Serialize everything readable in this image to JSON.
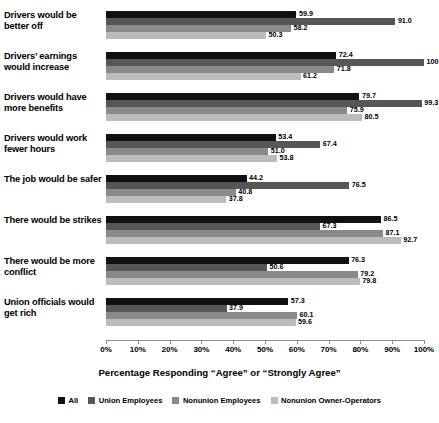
{
  "chart_data": {
    "type": "bar",
    "orientation": "horizontal",
    "title": "",
    "xlabel": "Percentage Responding “Agree” or “Strongly Agree”",
    "ylabel": "",
    "xlim": [
      0,
      100
    ],
    "grid": false,
    "legend_position": "bottom",
    "tick_labels": [
      "0%",
      "10%",
      "20%",
      "30%",
      "40%",
      "50%",
      "60%",
      "70%",
      "80%",
      "90%",
      "100%"
    ],
    "tick_values": [
      0,
      10,
      20,
      30,
      40,
      50,
      60,
      70,
      80,
      90,
      100
    ],
    "categories": [
      "Drivers would be better off",
      "Drivers’ earnings would increase",
      "Drivers would have more benefits",
      "Drivers would work fewer hours",
      "The job would be safer",
      "There would be strikes",
      "There would be more conflict",
      "Union officials would get rich"
    ],
    "series": [
      {
        "name": "All",
        "color": "#111111",
        "values": [
          59.9,
          72.4,
          79.7,
          53.4,
          44.2,
          86.5,
          76.3,
          57.3
        ],
        "labels": [
          "59.9",
          "72.4",
          "79.7",
          "53.4",
          "44.2",
          "86.5",
          "76.3",
          "57.3"
        ]
      },
      {
        "name": "Union Employees",
        "color": "#565656",
        "values": [
          91.0,
          100,
          99.3,
          67.4,
          76.5,
          67.3,
          50.6,
          37.9
        ],
        "labels": [
          "91.0",
          "100",
          "99.3",
          "67.4",
          "76.5",
          "67.3",
          "50.6",
          "37.9"
        ]
      },
      {
        "name": "Nonunion Employees",
        "color": "#8a8a8a",
        "values": [
          58.2,
          71.8,
          75.9,
          51.0,
          40.8,
          87.1,
          79.2,
          60.1
        ],
        "labels": [
          "58.2",
          "71.8",
          "75.9",
          "51.0",
          "40.8",
          "87.1",
          "79.2",
          "60.1"
        ]
      },
      {
        "name": "Nonunion Owner-Operators",
        "color": "#bcbcbc",
        "values": [
          50.3,
          61.2,
          80.5,
          53.8,
          37.8,
          92.7,
          79.8,
          59.6
        ],
        "labels": [
          "50.3",
          "61.2",
          "80.5",
          "53.8",
          "37.8",
          "92.7",
          "79.8",
          "59.6"
        ]
      }
    ]
  }
}
